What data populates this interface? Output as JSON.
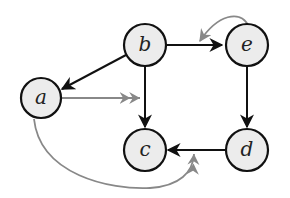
{
  "diagram": {
    "type": "directed-graph",
    "colors": {
      "node_fill": "#ececec",
      "node_stroke": "#111111",
      "edge_primary": "#111111",
      "edge_secondary": "#888888"
    },
    "nodes": [
      {
        "id": "a",
        "label": "a"
      },
      {
        "id": "b",
        "label": "b"
      },
      {
        "id": "c",
        "label": "c"
      },
      {
        "id": "d",
        "label": "d"
      },
      {
        "id": "e",
        "label": "e"
      }
    ],
    "edges": [
      {
        "from": "b",
        "to": "a",
        "style": "black"
      },
      {
        "from": "b",
        "to": "c",
        "style": "black"
      },
      {
        "from": "b",
        "to": "e",
        "style": "black"
      },
      {
        "from": "e",
        "to": "d",
        "style": "black"
      },
      {
        "from": "d",
        "to": "c",
        "style": "black"
      },
      {
        "from": "a",
        "to": "edge b-c",
        "style": "gray",
        "arrow": "double"
      },
      {
        "from": "a",
        "to": "edge d-c",
        "style": "gray",
        "arrow": "double",
        "curved": true
      },
      {
        "from": "e",
        "to": "edge b-e",
        "style": "gray",
        "arrow": "single",
        "curved": true
      }
    ]
  }
}
